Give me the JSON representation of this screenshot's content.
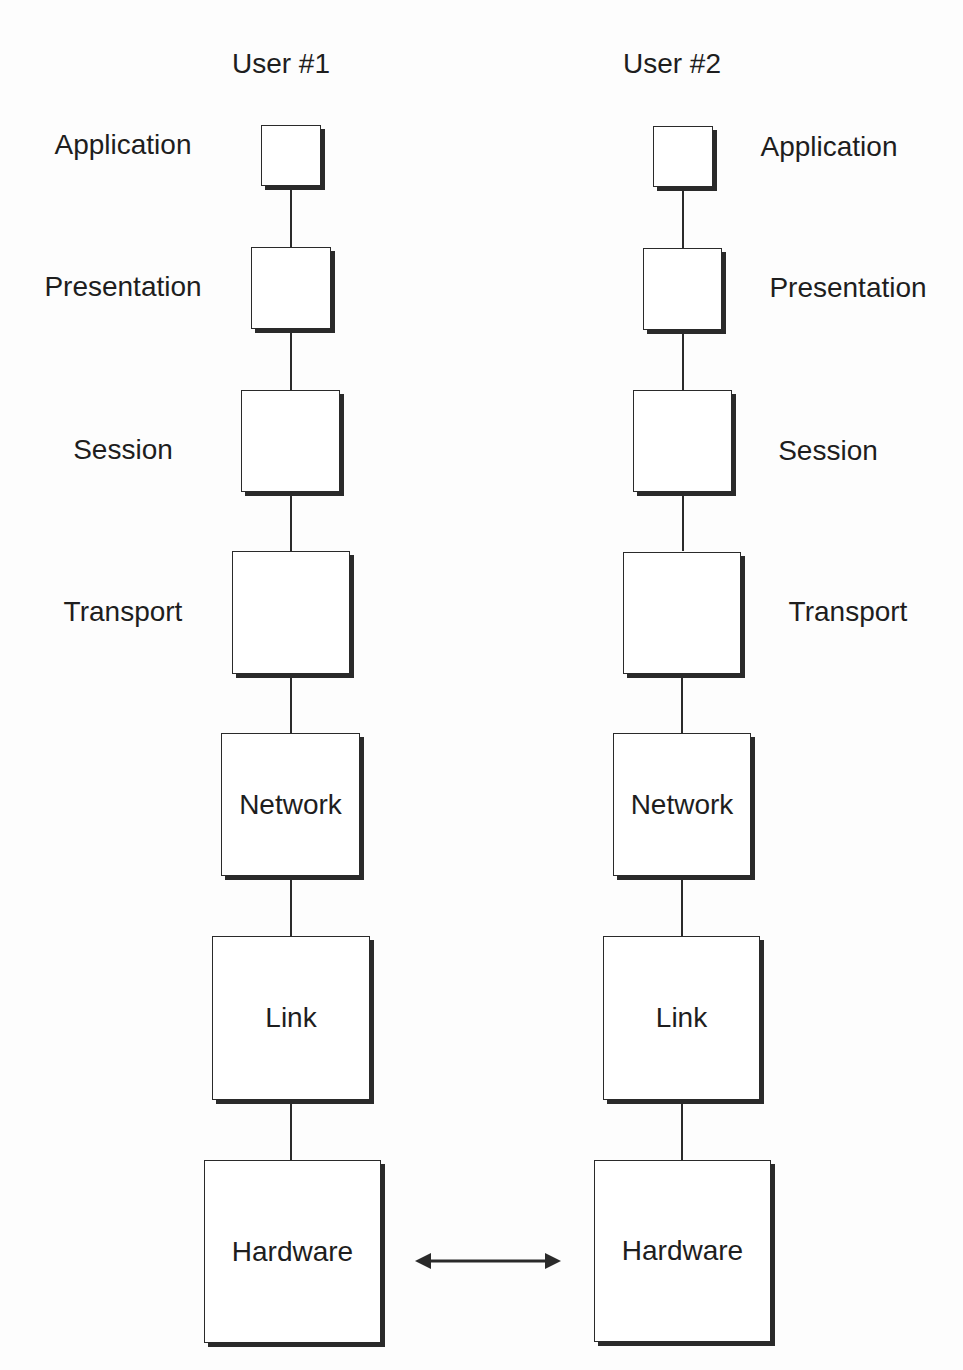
{
  "users": [
    {
      "name": "User #1",
      "layers": [
        {
          "name": "Application",
          "box_text": ""
        },
        {
          "name": "Presentation",
          "box_text": ""
        },
        {
          "name": "Session",
          "box_text": ""
        },
        {
          "name": "Transport",
          "box_text": ""
        },
        {
          "name": "Network",
          "box_text": "Network"
        },
        {
          "name": "Link",
          "box_text": "Link"
        },
        {
          "name": "Hardware",
          "box_text": "Hardware"
        }
      ]
    },
    {
      "name": "User #2",
      "layers": [
        {
          "name": "Application",
          "box_text": ""
        },
        {
          "name": "Presentation",
          "box_text": ""
        },
        {
          "name": "Session",
          "box_text": ""
        },
        {
          "name": "Transport",
          "box_text": ""
        },
        {
          "name": "Network",
          "box_text": "Network"
        },
        {
          "name": "Link",
          "box_text": "Link"
        },
        {
          "name": "Hardware",
          "box_text": "Hardware"
        }
      ]
    }
  ],
  "connection": {
    "from": "User #1 Hardware",
    "to": "User #2 Hardware",
    "type": "bidirectional-arrow"
  },
  "colors": {
    "stroke": "#2a2a2a",
    "background": "#fdfdfd",
    "box_fill": "#ffffff"
  }
}
